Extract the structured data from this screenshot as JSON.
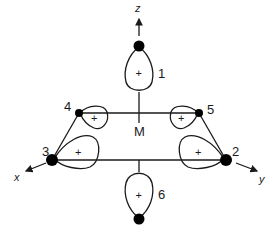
{
  "diagram": {
    "title": "",
    "center_label": "M",
    "axes": {
      "z": "z",
      "x": "x",
      "y": "y"
    },
    "ligands": [
      {
        "id": "1",
        "label": "1",
        "lobe_sign": "+"
      },
      {
        "id": "2",
        "label": "2",
        "lobe_sign": "+"
      },
      {
        "id": "3",
        "label": "3",
        "lobe_sign": "+"
      },
      {
        "id": "4",
        "label": "4",
        "lobe_sign": "+"
      },
      {
        "id": "5",
        "label": "5",
        "lobe_sign": "+"
      },
      {
        "id": "6",
        "label": "6",
        "lobe_sign": "+"
      }
    ],
    "colors": {
      "line": "#1a1a1a",
      "atom": "#000000",
      "background": "#ffffff"
    }
  }
}
